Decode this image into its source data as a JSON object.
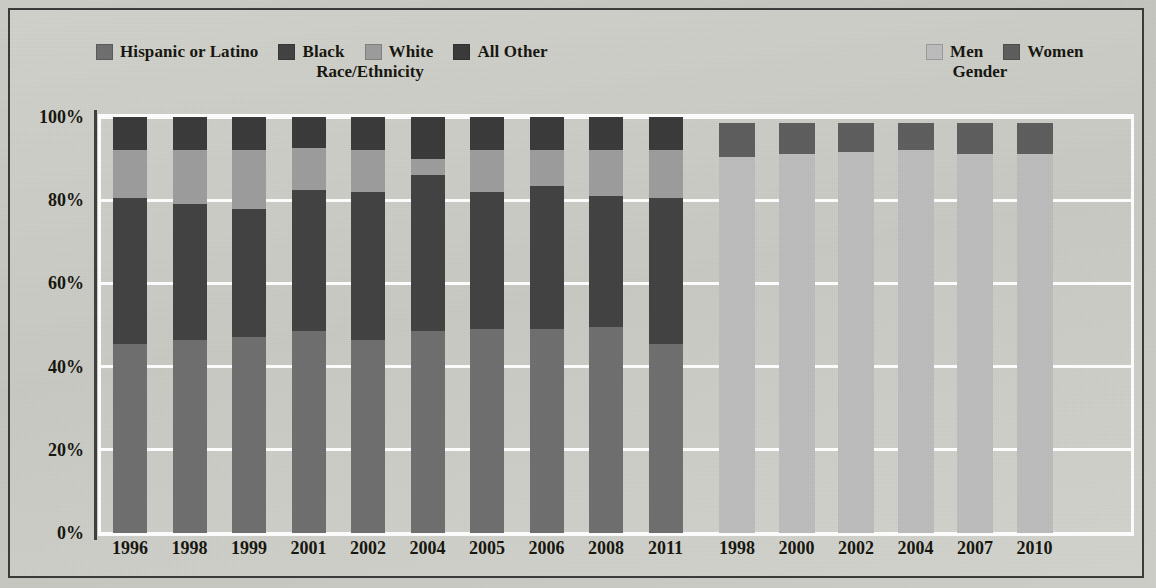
{
  "chart_data": {
    "type": "bar",
    "subtype": "stacked-percentage",
    "title": "",
    "xlabel": "",
    "ylabel": "",
    "ylim": [
      0,
      100
    ],
    "ytick_labels": [
      "0%",
      "20%",
      "40%",
      "60%",
      "80%",
      "100%"
    ],
    "ytick_values": [
      0,
      20,
      40,
      60,
      80,
      100
    ],
    "grid": true,
    "legend_position": "top",
    "panels": [
      {
        "name": "race-ethnicity",
        "title": "Race/Ethnicity",
        "categories": [
          "1996",
          "1998",
          "1999",
          "2001",
          "2002",
          "2004",
          "2005",
          "2006",
          "2008",
          "2011"
        ],
        "series": [
          {
            "name": "Hispanic or Latino",
            "color": "#6f6f6f",
            "values": [
              45.5,
              46.5,
              47.0,
              48.5,
              46.5,
              48.5,
              49.0,
              49.0,
              49.5,
              45.5
            ]
          },
          {
            "name": "Black",
            "color": "#424242",
            "values": [
              35.0,
              32.5,
              31.0,
              34.0,
              35.5,
              37.5,
              33.0,
              34.5,
              31.5,
              35.0
            ]
          },
          {
            "name": "White",
            "color": "#9d9d9d",
            "values": [
              11.5,
              13.0,
              14.0,
              10.0,
              10.0,
              4.0,
              10.0,
              8.5,
              11.0,
              11.5
            ]
          },
          {
            "name": "All Other",
            "color": "#3a3a3a",
            "values": [
              8.0,
              8.0,
              8.0,
              7.5,
              8.0,
              10.0,
              8.0,
              8.0,
              8.0,
              8.0
            ]
          }
        ]
      },
      {
        "name": "gender",
        "title": "Gender",
        "categories": [
          "1998",
          "2000",
          "2002",
          "2004",
          "2007",
          "2010"
        ],
        "series": [
          {
            "name": "Men",
            "color": "#bdbdbd",
            "values": [
              90.5,
              91.0,
              91.5,
              92.0,
              91.0,
              91.0
            ]
          },
          {
            "name": "Women",
            "color": "#5e5e5e",
            "values": [
              8.0,
              7.5,
              7.0,
              6.5,
              7.5,
              7.5
            ]
          }
        ]
      }
    ]
  },
  "legends": {
    "race": {
      "items": [
        {
          "label": "Hispanic or Latino",
          "color": "#6f6f6f",
          "swatch_icon": "legend-swatch-icon"
        },
        {
          "label": "Black",
          "color": "#424242",
          "swatch_icon": "legend-swatch-icon"
        },
        {
          "label": "White",
          "color": "#9d9d9d",
          "swatch_icon": "legend-swatch-icon"
        },
        {
          "label": "All Other",
          "color": "#3a3a3a",
          "swatch_icon": "legend-swatch-icon"
        }
      ]
    },
    "gender": {
      "items": [
        {
          "label": "Men",
          "color": "#bdbdbd",
          "swatch_icon": "legend-swatch-icon"
        },
        {
          "label": "Women",
          "color": "#5e5e5e",
          "swatch_icon": "legend-swatch-icon"
        }
      ]
    }
  },
  "group_titles": {
    "race": "Race/Ethnicity",
    "gender": "Gender"
  },
  "colors": {
    "frame": "#3a3a38",
    "background": "#cdcdc8",
    "gridline": "#ffffff",
    "text": "#16160f"
  }
}
